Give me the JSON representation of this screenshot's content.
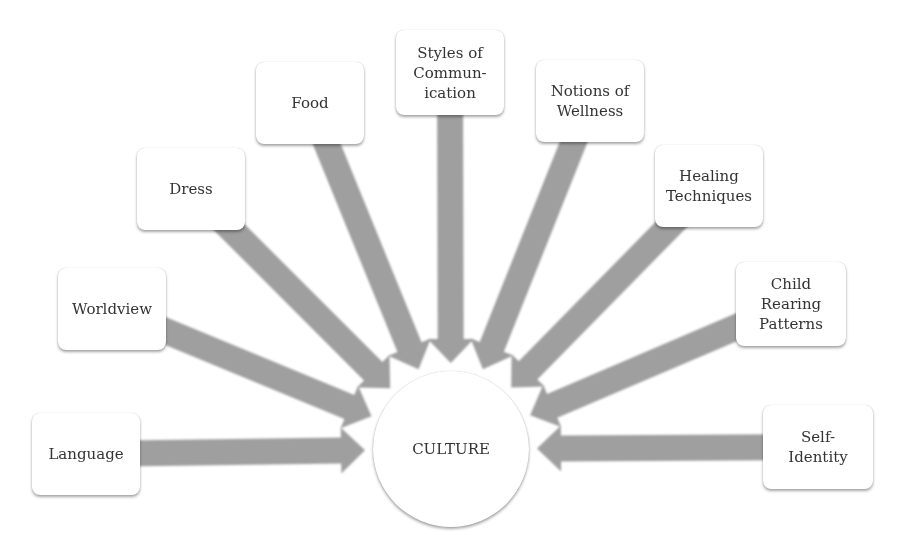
{
  "diagram": {
    "center": {
      "label": "CULTURE",
      "cx": 451,
      "cy": 449,
      "r": 78
    },
    "arrow_color": "#9a9a9a",
    "nodes": [
      {
        "id": "language",
        "label": "Language",
        "x": 32,
        "y": 413,
        "w": 108,
        "h": 82
      },
      {
        "id": "worldview",
        "label": "Worldview",
        "x": 58,
        "y": 268,
        "w": 108,
        "h": 82
      },
      {
        "id": "dress",
        "label": "Dress",
        "x": 137,
        "y": 148,
        "w": 108,
        "h": 82
      },
      {
        "id": "food",
        "label": "Food",
        "x": 256,
        "y": 62,
        "w": 108,
        "h": 82
      },
      {
        "id": "styles-of-communication",
        "label": "Styles of\nCommun-\nication",
        "x": 396,
        "y": 30,
        "w": 108,
        "h": 85
      },
      {
        "id": "notions-of-wellness",
        "label": "Notions of\nWellness",
        "x": 536,
        "y": 60,
        "w": 108,
        "h": 82
      },
      {
        "id": "healing-techniques",
        "label": "Healing\nTechniques",
        "x": 655,
        "y": 145,
        "w": 108,
        "h": 82
      },
      {
        "id": "child-rearing-patterns",
        "label": "Child\nRearing\nPatterns",
        "x": 736,
        "y": 262,
        "w": 110,
        "h": 84
      },
      {
        "id": "self-identity",
        "label": "Self-\nIdentity",
        "x": 763,
        "y": 405,
        "w": 110,
        "h": 84
      }
    ]
  }
}
